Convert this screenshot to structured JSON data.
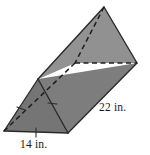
{
  "figure": {
    "kind": "triangular-prism",
    "colors": {
      "face_top_light": "#919191",
      "face_side_medium": "#7d7d7d",
      "face_front_triangle": "#757575",
      "edge_stroke": "#2b2b2b",
      "hidden_edge_stroke": "#1f1f1f",
      "background": "#ffffff",
      "label_text": "#1a1a1a"
    },
    "labels": {
      "length": "22 in.",
      "base": "14 in."
    },
    "tick_marks": {
      "count": 3,
      "note": "congruence ticks on the two slant sides and the base of the front triangle"
    }
  }
}
